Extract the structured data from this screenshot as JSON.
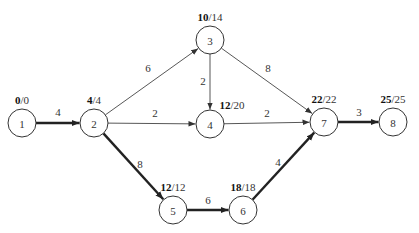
{
  "diagram": {
    "type": "activity-network",
    "nodes": [
      {
        "id": "1",
        "label": "1",
        "x": 22,
        "y": 123,
        "early": "0",
        "late": "0",
        "lx": 22,
        "ly": 104
      },
      {
        "id": "2",
        "label": "2",
        "x": 94,
        "y": 123,
        "early": "4",
        "late": "4",
        "lx": 94,
        "ly": 104
      },
      {
        "id": "3",
        "label": "3",
        "x": 210,
        "y": 40,
        "early": "10",
        "late": "14",
        "lx": 210,
        "ly": 21
      },
      {
        "id": "4",
        "label": "4",
        "x": 210,
        "y": 124,
        "early": "12",
        "late": "20",
        "lx": 232,
        "ly": 109
      },
      {
        "id": "5",
        "label": "5",
        "x": 173,
        "y": 210,
        "early": "12",
        "late": "12",
        "lx": 173,
        "ly": 191
      },
      {
        "id": "6",
        "label": "6",
        "x": 243,
        "y": 210,
        "early": "18",
        "late": "18",
        "lx": 243,
        "ly": 191
      },
      {
        "id": "7",
        "label": "7",
        "x": 324,
        "y": 122,
        "early": "22",
        "late": "22",
        "lx": 324,
        "ly": 103
      },
      {
        "id": "8",
        "label": "8",
        "x": 393,
        "y": 122,
        "early": "25",
        "late": "25",
        "lx": 393,
        "ly": 103
      }
    ],
    "edges": [
      {
        "from": "1",
        "to": "2",
        "weight": "4",
        "critical": true,
        "wx": 58,
        "wy": 116
      },
      {
        "from": "2",
        "to": "3",
        "weight": "6",
        "critical": false,
        "wx": 148,
        "wy": 72
      },
      {
        "from": "2",
        "to": "4",
        "weight": "2",
        "critical": false,
        "wx": 155,
        "wy": 117
      },
      {
        "from": "2",
        "to": "5",
        "weight": "8",
        "critical": true,
        "wx": 140,
        "wy": 168
      },
      {
        "from": "3",
        "to": "4",
        "weight": "2",
        "critical": false,
        "wx": 203,
        "wy": 85
      },
      {
        "from": "3",
        "to": "7",
        "weight": "8",
        "critical": false,
        "wx": 268,
        "wy": 72
      },
      {
        "from": "4",
        "to": "7",
        "weight": "2",
        "critical": false,
        "wx": 267,
        "wy": 117
      },
      {
        "from": "5",
        "to": "6",
        "weight": "6",
        "critical": true,
        "wx": 208,
        "wy": 204
      },
      {
        "from": "6",
        "to": "7",
        "weight": "4",
        "critical": true,
        "wx": 278,
        "wy": 166
      },
      {
        "from": "7",
        "to": "8",
        "weight": "3",
        "critical": true,
        "wx": 359,
        "wy": 116
      }
    ],
    "node_radius": 14,
    "colors": {
      "stroke": "#333333",
      "critical": "#222222",
      "background": "#ffffff"
    }
  }
}
